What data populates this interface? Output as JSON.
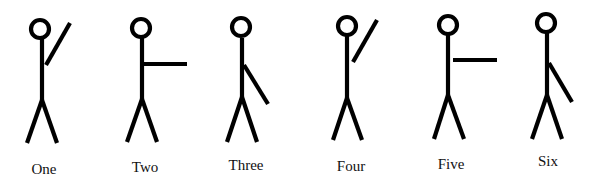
{
  "figures": [
    {
      "label": "One",
      "arm": "raised-diagonal",
      "head": {
        "cx": 40,
        "cy": 29,
        "r": 9
      },
      "body": [
        42,
        39,
        42,
        100
      ],
      "arm_line": [
        46,
        65,
        70,
        23
      ],
      "legs": [
        [
          42,
          100,
          27,
          143
        ],
        [
          42,
          100,
          57,
          143
        ]
      ],
      "label_pos": {
        "x": 44,
        "y": 162
      }
    },
    {
      "label": "Two",
      "arm": "horizontal",
      "head": {
        "cx": 141,
        "cy": 28,
        "r": 9
      },
      "body": [
        142,
        38,
        142,
        99
      ],
      "arm_line": [
        144,
        64,
        187,
        64
      ],
      "legs": [
        [
          142,
          99,
          127,
          142
        ],
        [
          142,
          99,
          157,
          142
        ]
      ],
      "label_pos": {
        "x": 145,
        "y": 160
      }
    },
    {
      "label": "Three",
      "arm": "lowered-diagonal",
      "head": {
        "cx": 241,
        "cy": 27,
        "r": 9
      },
      "body": [
        242,
        38,
        242,
        97
      ],
      "arm_line": [
        244,
        65,
        268,
        104
      ],
      "legs": [
        [
          242,
          97,
          227,
          142
        ],
        [
          242,
          97,
          257,
          142
        ]
      ],
      "label_pos": {
        "x": 246,
        "y": 158
      }
    },
    {
      "label": "Four",
      "arm": "raised-diagonal",
      "head": {
        "cx": 347,
        "cy": 26,
        "r": 9
      },
      "body": [
        347,
        36,
        347,
        98
      ],
      "arm_line": [
        353,
        62,
        377,
        20
      ],
      "legs": [
        [
          347,
          98,
          333,
          140
        ],
        [
          347,
          98,
          362,
          140
        ]
      ],
      "label_pos": {
        "x": 351,
        "y": 159
      }
    },
    {
      "label": "Five",
      "arm": "horizontal",
      "head": {
        "cx": 448,
        "cy": 25,
        "r": 9
      },
      "body": [
        448,
        35,
        448,
        95
      ],
      "arm_line": [
        453,
        60,
        497,
        60
      ],
      "legs": [
        [
          448,
          95,
          434,
          139
        ],
        [
          448,
          95,
          464,
          139
        ]
      ],
      "label_pos": {
        "x": 451,
        "y": 157
      }
    },
    {
      "label": "Six",
      "arm": "lowered-diagonal",
      "head": {
        "cx": 546,
        "cy": 23,
        "r": 9
      },
      "body": [
        547,
        33,
        547,
        95
      ],
      "arm_line": [
        549,
        63,
        572,
        102
      ],
      "legs": [
        [
          547,
          95,
          532,
          139
        ],
        [
          547,
          95,
          562,
          139
        ]
      ],
      "label_pos": {
        "x": 548,
        "y": 154
      }
    }
  ],
  "colors": {
    "stroke": "#000000",
    "text": "#111111",
    "background": "#ffffff"
  }
}
